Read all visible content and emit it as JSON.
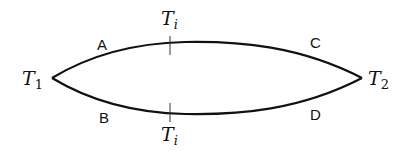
{
  "diagram": {
    "nodes": {
      "left": {
        "base": "T",
        "sub": "1"
      },
      "right": {
        "base": "T",
        "sub": "2"
      }
    },
    "paths": {
      "upper": {
        "label_left": "A",
        "label_right": "C"
      },
      "lower": {
        "label_left": "B",
        "label_right": "D"
      }
    },
    "ticks": {
      "upper": {
        "base": "T",
        "sub": "i"
      },
      "lower": {
        "base": "T",
        "sub": "i"
      }
    },
    "colors": {
      "stroke": "#111111",
      "background": "#ffffff"
    }
  }
}
